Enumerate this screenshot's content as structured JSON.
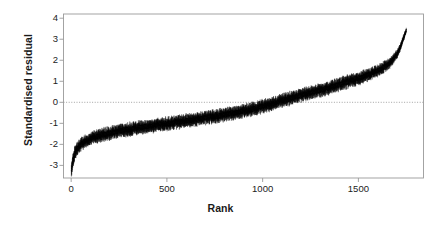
{
  "chart_data": {
    "type": "scatter",
    "title": "",
    "xlabel": "Rank",
    "ylabel": "Standardised residual",
    "xlim": [
      -40,
      1840
    ],
    "ylim": [
      -3.6,
      4.2
    ],
    "xticks": [
      0,
      500,
      1000,
      1500
    ],
    "xtick_labels": [
      "0",
      "500",
      "1000",
      "1500"
    ],
    "yticks": [
      -3,
      -2,
      -1,
      0,
      1,
      2,
      3,
      4
    ],
    "ytick_labels": [
      "-3",
      "-2",
      "-1",
      "0",
      "1",
      "2",
      "3",
      "4"
    ],
    "grid": false,
    "reference_lines": [
      {
        "axis": "y",
        "value": 0,
        "style": "dotted",
        "color": "#999999"
      }
    ],
    "marker": "point-with-errorbar",
    "marker_color": "#000000",
    "n_points": 1750,
    "series": [
      {
        "name": "Standardised residual (sorted)",
        "description": "Sorted standardised residuals for 1750 ranked units, with small vertical error bars; curve rises monotonically from about -3.3 at rank 1 through zero near rank 1060 to about +3.4 at rank 1750.",
        "x": [
          1,
          10,
          20,
          30,
          45,
          60,
          80,
          100,
          130,
          160,
          200,
          250,
          300,
          360,
          420,
          480,
          550,
          620,
          700,
          780,
          860,
          940,
          1020,
          1060,
          1100,
          1180,
          1260,
          1340,
          1420,
          1490,
          1550,
          1610,
          1660,
          1700,
          1720,
          1735,
          1745,
          1750
        ],
        "y": [
          -3.3,
          -2.7,
          -2.4,
          -2.22,
          -2.05,
          -1.93,
          -1.82,
          -1.74,
          -1.64,
          -1.56,
          -1.47,
          -1.37,
          -1.29,
          -1.2,
          -1.12,
          -1.04,
          -0.95,
          -0.86,
          -0.74,
          -0.62,
          -0.49,
          -0.34,
          -0.14,
          -0.03,
          0.08,
          0.28,
          0.48,
          0.68,
          0.9,
          1.1,
          1.3,
          1.55,
          1.82,
          2.25,
          2.65,
          3.05,
          3.3,
          3.42
        ],
        "band_halfwidth": [
          0.22,
          0.22,
          0.21,
          0.21,
          0.21,
          0.2,
          0.2,
          0.2,
          0.2,
          0.2,
          0.2,
          0.2,
          0.2,
          0.2,
          0.2,
          0.2,
          0.2,
          0.2,
          0.2,
          0.2,
          0.2,
          0.2,
          0.2,
          0.2,
          0.2,
          0.2,
          0.2,
          0.2,
          0.2,
          0.2,
          0.19,
          0.18,
          0.16,
          0.14,
          0.12,
          0.1,
          0.09,
          0.08
        ]
      }
    ]
  },
  "axes": {
    "frame_color": "#9a9a9a",
    "tick_color": "#9a9a9a",
    "text_color": "#1a1a1a"
  }
}
